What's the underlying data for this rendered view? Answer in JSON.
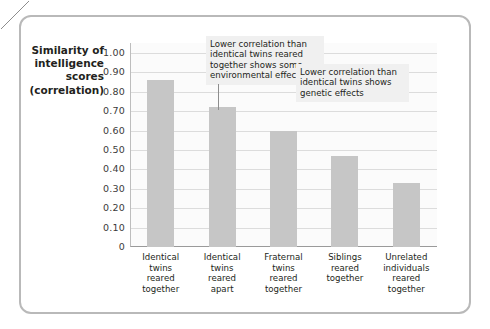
{
  "chart_data": {
    "type": "bar",
    "title": "",
    "xlabel": "",
    "ylabel": "Similarity of intelligence scores (correlation)",
    "ylim": [
      0,
      1.0
    ],
    "grid": true,
    "legend": "none",
    "categories": [
      "Identical twins reared together",
      "Identical twins reared apart",
      "Fraternal twins reared together",
      "Siblings reared together",
      "Unrelated individuals reared together"
    ],
    "values": [
      0.86,
      0.72,
      0.6,
      0.47,
      0.33
    ],
    "ytick_labels": [
      "1.00",
      "0.90",
      "0.80",
      "0.70",
      "0.60",
      "0.50",
      "0.40",
      "0.30",
      "0.20",
      "0.10",
      "0"
    ],
    "ytick_values": [
      1.0,
      0.9,
      0.8,
      0.7,
      0.6,
      0.5,
      0.4,
      0.3,
      0.2,
      0.1,
      0.0
    ],
    "annotations": [
      {
        "id": "environmental",
        "text": "Lower correlation than identical twins reared together shows some environmental effect",
        "points_to": "Identical twins reared apart"
      },
      {
        "id": "genetic",
        "text": "Lower correlation than identical twins shows genetic effects",
        "points_to": "Fraternal twins reared together"
      }
    ],
    "colors": {
      "bar": "#c6c6c6",
      "gridline": "#dcdcdc",
      "plot_background": "#fbfbfb",
      "annotation_background": "#f0f0f0",
      "frame_border": "#b9b9b9",
      "text": "#231f20"
    }
  },
  "axis": {
    "y_title_lines": [
      "Similarity of",
      "intelligence",
      "scores",
      "(correlation)"
    ]
  },
  "xlabels_wrapped": [
    [
      "Identical",
      "twins",
      "reared",
      "together"
    ],
    [
      "Identical",
      "twins",
      "reared",
      "apart"
    ],
    [
      "Fraternal",
      "twins",
      "reared",
      "together"
    ],
    [
      "Siblings",
      "reared",
      "together"
    ],
    [
      "Unrelated",
      "individuals",
      "reared",
      "together"
    ]
  ]
}
